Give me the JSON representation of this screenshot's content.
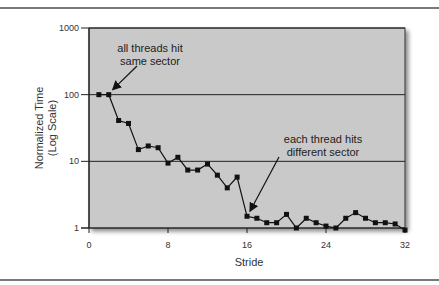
{
  "chart_data": {
    "type": "line",
    "title": "",
    "xlabel": "Stride",
    "ylabel": [
      "Normalized Time",
      "(Log Scale)"
    ],
    "yscale": "log",
    "xlim": [
      0,
      32
    ],
    "ylim": [
      1,
      1000
    ],
    "xticks": [
      0,
      8,
      16,
      24,
      32
    ],
    "xtick_labels": [
      "0",
      "8",
      "16",
      "24",
      "32"
    ],
    "yticks": [
      1,
      10,
      100,
      1000
    ],
    "ytick_labels": [
      "1",
      "10",
      "100",
      "1000"
    ],
    "grid": "horizontal",
    "legend": "none",
    "plot_background": "#c9c9c9",
    "line_color": "#111111",
    "series": [
      {
        "name": "Normalized Time",
        "x": [
          1,
          2,
          3,
          4,
          5,
          6,
          7,
          8,
          9,
          10,
          11,
          12,
          13,
          14,
          15,
          16,
          17,
          18,
          19,
          20,
          21,
          22,
          23,
          24,
          25,
          26,
          27,
          28,
          29,
          30,
          31,
          32
        ],
        "values": [
          100,
          100,
          41,
          37,
          15,
          17,
          16,
          9.4,
          11.5,
          7.4,
          7.4,
          9.1,
          6.2,
          4.0,
          5.8,
          1.5,
          1.4,
          1.2,
          1.2,
          1.6,
          1.0,
          1.4,
          1.2,
          1.07,
          1.0,
          1.4,
          1.7,
          1.4,
          1.2,
          1.2,
          1.15,
          0.93
        ]
      }
    ],
    "annotations": [
      {
        "lines": [
          "all threads hit",
          "same sector"
        ],
        "points_to": {
          "x": 2,
          "y": 100
        }
      },
      {
        "lines": [
          "each thread hits",
          "different sector"
        ],
        "points_to": {
          "x": 16,
          "y": 1.5
        }
      }
    ]
  }
}
